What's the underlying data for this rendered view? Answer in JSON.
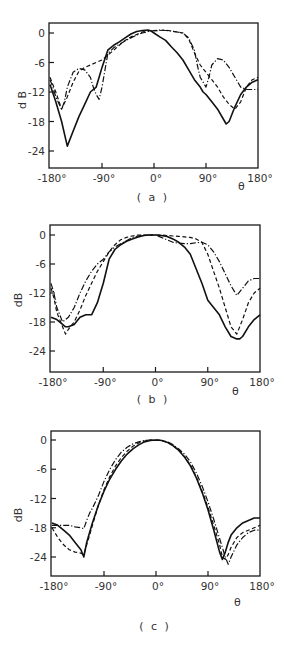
{
  "chart_data": [
    {
      "type": "line",
      "title": "",
      "caption": "( a )",
      "xlabel": "θ",
      "ylabel": "d B",
      "xlim": [
        -180,
        180
      ],
      "ylim": [
        -27,
        1.5
      ],
      "xticks": [
        -180,
        -90,
        0,
        90,
        180
      ],
      "xtick_labels": [
        "-180°",
        "-90°",
        "0°",
        "90°",
        "180°"
      ],
      "yticks": [
        0,
        -6,
        -12,
        -18,
        -24
      ],
      "ytick_labels": [
        "0",
        "-6",
        "-12",
        "-18",
        "-24"
      ],
      "grid": false,
      "legend": "none",
      "series": [
        {
          "name": "solid",
          "style": "solid",
          "x": [
            -180,
            -170,
            -160,
            -150,
            -140,
            -130,
            -120,
            -110,
            -100,
            -95,
            -90,
            -80,
            -70,
            -60,
            -50,
            -40,
            -30,
            -20,
            -10,
            -5,
            0,
            10,
            20,
            30,
            40,
            50,
            60,
            70,
            80,
            85,
            90,
            100,
            110,
            120,
            125,
            130,
            140,
            150,
            160,
            170,
            180
          ],
          "y": [
            -10.5,
            -14,
            -18,
            -23,
            -20,
            -17,
            -14.5,
            -12,
            -11,
            -9,
            -7,
            -3.5,
            -2.5,
            -1.8,
            -1,
            -0.2,
            0.3,
            0.5,
            0.6,
            0.4,
            0,
            -0.8,
            -1.5,
            -2.8,
            -4,
            -5.5,
            -7.5,
            -9.5,
            -11,
            -12,
            -12.5,
            -14,
            -15.5,
            -17.5,
            -18.5,
            -18,
            -15,
            -12.5,
            -11,
            -10,
            -9.5
          ]
        },
        {
          "name": "dashed",
          "style": "dashed",
          "x": [
            -180,
            -170,
            -160,
            -150,
            -140,
            -130,
            -120,
            -110,
            -100,
            -90,
            -80,
            -70,
            -60,
            -50,
            -40,
            -30,
            -20,
            -10,
            0,
            10,
            20,
            30,
            40,
            50,
            60,
            70,
            80,
            90,
            100,
            110,
            120,
            130,
            140,
            150,
            160,
            170,
            180
          ],
          "y": [
            -9,
            -12,
            -15.5,
            -13,
            -10,
            -7.8,
            -7,
            -6.5,
            -6,
            -5.5,
            -4.5,
            -3.5,
            -2.5,
            -1.5,
            -0.8,
            -0.3,
            0.2,
            0.5,
            0.4,
            0.5,
            0.6,
            0.4,
            0.2,
            0,
            -1.2,
            -4,
            -6.5,
            -8,
            -9.5,
            -11,
            -13,
            -14.5,
            -15.5,
            -14,
            -11,
            -9.5,
            -9
          ]
        },
        {
          "name": "dash-dot",
          "style": "dashdot",
          "x": [
            -180,
            -175,
            -170,
            -160,
            -155,
            -150,
            -140,
            -130,
            -120,
            -110,
            -105,
            -100,
            -95,
            -90,
            -80,
            -70,
            -60,
            -50,
            -40,
            -30,
            -20,
            -10,
            0,
            10,
            20,
            30,
            40,
            50,
            60,
            70,
            75,
            80,
            90,
            95,
            100,
            110,
            120,
            130,
            140,
            150,
            160,
            170,
            180
          ],
          "y": [
            -9.5,
            -11,
            -13,
            -15.5,
            -14,
            -11,
            -8,
            -7.2,
            -7.5,
            -9,
            -11,
            -12.5,
            -13.5,
            -11,
            -4.2,
            -3,
            -2.3,
            -1.6,
            -1,
            -0.4,
            0,
            0.3,
            0.5,
            0.6,
            0.5,
            0.4,
            0.2,
            0,
            -1,
            -3.5,
            -6.5,
            -9,
            -11,
            -9,
            -6.5,
            -5.2,
            -5.5,
            -7,
            -9,
            -11,
            -11.5,
            -11.5,
            -11.5
          ]
        }
      ]
    },
    {
      "type": "line",
      "title": "",
      "caption": "( b )",
      "xlabel": "θ",
      "ylabel": "dB",
      "xlim": [
        -180,
        180
      ],
      "ylim": [
        -27,
        1.5
      ],
      "xticks": [
        -180,
        -90,
        0,
        90,
        180
      ],
      "xtick_labels": [
        "-180°",
        "-90°",
        "0°",
        "90°",
        "180°"
      ],
      "yticks": [
        0,
        -6,
        -12,
        -18,
        -24
      ],
      "ytick_labels": [
        "0",
        "-6",
        "-12",
        "-18",
        "-24"
      ],
      "grid": false,
      "legend": "none",
      "series": [
        {
          "name": "solid",
          "style": "solid",
          "x": [
            -180,
            -170,
            -160,
            -155,
            -150,
            -140,
            -130,
            -120,
            -110,
            -100,
            -95,
            -90,
            -80,
            -70,
            -60,
            -50,
            -40,
            -30,
            -20,
            -10,
            0,
            10,
            20,
            30,
            40,
            50,
            60,
            70,
            80,
            90,
            100,
            110,
            120,
            130,
            140,
            145,
            150,
            160,
            170,
            180
          ],
          "y": [
            -17,
            -17.5,
            -18.5,
            -19,
            -19,
            -18.5,
            -17,
            -16.5,
            -16.5,
            -14,
            -12,
            -10,
            -5,
            -3,
            -2,
            -1.3,
            -0.8,
            -0.4,
            -0.1,
            0,
            0,
            -0.1,
            -0.3,
            -0.8,
            -1.5,
            -2.5,
            -4,
            -7,
            -10,
            -13.5,
            -15,
            -16.5,
            -19,
            -21,
            -21.5,
            -21.5,
            -21,
            -19,
            -17.5,
            -16.5
          ]
        },
        {
          "name": "dashed",
          "style": "dashed",
          "x": [
            -180,
            -175,
            -170,
            -160,
            -155,
            -150,
            -140,
            -130,
            -120,
            -110,
            -100,
            -90,
            -80,
            -70,
            -60,
            -50,
            -40,
            -30,
            -20,
            -10,
            0,
            10,
            20,
            30,
            40,
            50,
            60,
            70,
            80,
            90,
            100,
            110,
            120,
            130,
            140,
            150,
            160,
            170,
            180
          ],
          "y": [
            -11,
            -13,
            -16,
            -19,
            -20.5,
            -19.5,
            -18,
            -15.5,
            -12.5,
            -10,
            -7.5,
            -5.5,
            -3.5,
            -2,
            -1,
            -0.5,
            -0.2,
            0,
            0,
            0,
            0,
            0,
            -0.1,
            -0.2,
            -0.3,
            -0.4,
            -0.5,
            -0.8,
            -1.5,
            -4,
            -7.5,
            -11,
            -15,
            -19,
            -20.5,
            -17.5,
            -14,
            -12,
            -11
          ]
        },
        {
          "name": "dash-dot",
          "style": "dashdot",
          "x": [
            -180,
            -175,
            -170,
            -160,
            -150,
            -140,
            -130,
            -120,
            -110,
            -100,
            -90,
            -80,
            -70,
            -60,
            -50,
            -40,
            -30,
            -20,
            -10,
            0,
            10,
            20,
            30,
            40,
            50,
            60,
            70,
            80,
            90,
            100,
            110,
            120,
            130,
            140,
            150,
            160,
            170,
            180
          ],
          "y": [
            -10,
            -12,
            -15,
            -18,
            -17,
            -15,
            -12,
            -9.5,
            -7.5,
            -6,
            -5,
            -3.5,
            -2.5,
            -1.8,
            -1.2,
            -0.5,
            -0.2,
            0,
            0,
            0,
            -0.5,
            -1,
            -1.5,
            -1.7,
            -1.8,
            -1.8,
            -1.6,
            -1.5,
            -2,
            -3.5,
            -5.5,
            -8,
            -10.5,
            -12.5,
            -11,
            -9.5,
            -9,
            -9
          ]
        }
      ]
    },
    {
      "type": "line",
      "title": "",
      "caption": "( c )",
      "xlabel": "θ",
      "ylabel": "dB",
      "xlim": [
        -180,
        180
      ],
      "ylim": [
        -27,
        1.5
      ],
      "xticks": [
        -180,
        -90,
        0,
        90,
        180
      ],
      "xtick_labels": [
        "-180°",
        "-90°",
        "0°",
        "90°",
        "180°"
      ],
      "yticks": [
        0,
        -6,
        -12,
        -18,
        -24
      ],
      "ytick_labels": [
        "0",
        "-6",
        "-12",
        "-18",
        "-24"
      ],
      "grid": false,
      "legend": "none",
      "series": [
        {
          "name": "solid",
          "style": "solid",
          "x": [
            -180,
            -170,
            -160,
            -150,
            -140,
            -130,
            -125,
            -120,
            -115,
            -110,
            -100,
            -90,
            -80,
            -70,
            -60,
            -50,
            -40,
            -30,
            -20,
            -10,
            0,
            10,
            20,
            30,
            40,
            50,
            60,
            70,
            80,
            90,
            100,
            110,
            115,
            120,
            125,
            130,
            140,
            150,
            160,
            170,
            180
          ],
          "y": [
            -17,
            -17.5,
            -18.5,
            -19.5,
            -21,
            -22.5,
            -24,
            -21,
            -19,
            -17,
            -13.5,
            -10.5,
            -8,
            -6,
            -4.3,
            -2.9,
            -1.8,
            -1,
            -0.4,
            -0.1,
            0,
            -0.1,
            -0.5,
            -1.2,
            -2.2,
            -3.6,
            -5.4,
            -7.8,
            -10.8,
            -14.3,
            -18.5,
            -23,
            -24.5,
            -23,
            -21,
            -19.5,
            -18,
            -17,
            -16.5,
            -16,
            -16
          ]
        },
        {
          "name": "dashed",
          "style": "dashed",
          "x": [
            -180,
            -170,
            -160,
            -150,
            -140,
            -130,
            -125,
            -120,
            -115,
            -110,
            -100,
            -90,
            -80,
            -70,
            -60,
            -50,
            -40,
            -30,
            -20,
            -10,
            0,
            10,
            20,
            30,
            40,
            50,
            60,
            70,
            80,
            90,
            100,
            110,
            115,
            120,
            125,
            130,
            140,
            150,
            160,
            170,
            180
          ],
          "y": [
            -18,
            -20,
            -21.5,
            -22.5,
            -23,
            -23.2,
            -23.5,
            -21.5,
            -19.5,
            -17.5,
            -13.5,
            -10.2,
            -7.5,
            -5.3,
            -3.6,
            -2.3,
            -1.3,
            -0.6,
            -0.2,
            0,
            0,
            -0.1,
            -0.5,
            -1.2,
            -2.2,
            -3.5,
            -5.3,
            -7.6,
            -10.5,
            -13.8,
            -17.5,
            -21.5,
            -24,
            -24.5,
            -23.5,
            -22,
            -20,
            -19,
            -18.5,
            -18,
            -17.5
          ]
        },
        {
          "name": "dash-dot",
          "style": "dashdot",
          "x": [
            -180,
            -170,
            -160,
            -150,
            -140,
            -130,
            -125,
            -120,
            -115,
            -110,
            -100,
            -90,
            -80,
            -70,
            -60,
            -50,
            -40,
            -30,
            -20,
            -10,
            0,
            10,
            20,
            30,
            40,
            50,
            60,
            70,
            80,
            90,
            100,
            110,
            120,
            125,
            130,
            140,
            150,
            160,
            170,
            180
          ],
          "y": [
            -17.5,
            -17.5,
            -17.5,
            -17.5,
            -17.8,
            -18,
            -18.2,
            -16.5,
            -15,
            -14,
            -11.5,
            -8.5,
            -6,
            -4,
            -2.5,
            -1.5,
            -0.8,
            -0.4,
            -0.1,
            0,
            0,
            -0.1,
            -0.4,
            -1,
            -1.9,
            -3,
            -4.6,
            -6.8,
            -9.5,
            -12.7,
            -16.3,
            -20.2,
            -24,
            -25.5,
            -24,
            -21.5,
            -20,
            -19,
            -18.5,
            -18.5
          ]
        }
      ]
    }
  ]
}
